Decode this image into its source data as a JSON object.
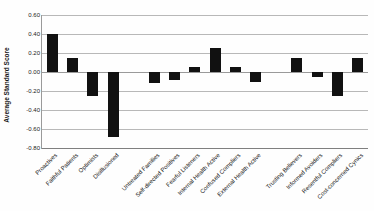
{
  "chart": {
    "colors": {
      "bar": "#111111",
      "gridline": "#b8b8b8",
      "axis": "#9a9a9a",
      "text": "#222222",
      "background": "#fefefe"
    }
  },
  "chart_data": {
    "type": "bar",
    "title": "",
    "xlabel": "",
    "ylabel": "Average Standard Score",
    "ylim": [
      -0.8,
      0.6
    ],
    "ytick_step": 0.2,
    "yticks": [
      0.6,
      0.4,
      0.2,
      0.0,
      -0.2,
      -0.4,
      -0.6,
      -0.8
    ],
    "ytick_labels": [
      "0.60",
      "0.40",
      "0.20",
      "0.00",
      "-0.20",
      "-0.40",
      "-0.60",
      "-0.80"
    ],
    "grid": true,
    "legend": null,
    "bar_color": "#111111",
    "categories": [
      "Proactives",
      "Faithful Patients",
      "Optimists",
      "Disillusioned",
      "Untreated Families",
      "Self-directed Positives",
      "Fearful Listeners",
      "Internal Health Active",
      "Confused Compliers",
      "External Health Active",
      "Trusting Believers",
      "Informed Avoiders",
      "Resentful Compliers",
      "Cost-concerned Cynics"
    ],
    "values": [
      0.4,
      0.15,
      -0.25,
      -0.68,
      -0.12,
      -0.08,
      0.05,
      0.25,
      0.05,
      -0.1,
      0.15,
      -0.05,
      -0.25,
      0.15
    ],
    "group_sizes": [
      4,
      6,
      4
    ],
    "slot_indices": [
      0,
      1,
      2,
      3,
      5,
      6,
      7,
      8,
      9,
      10,
      12,
      13,
      14,
      15
    ],
    "total_slots": 16
  }
}
